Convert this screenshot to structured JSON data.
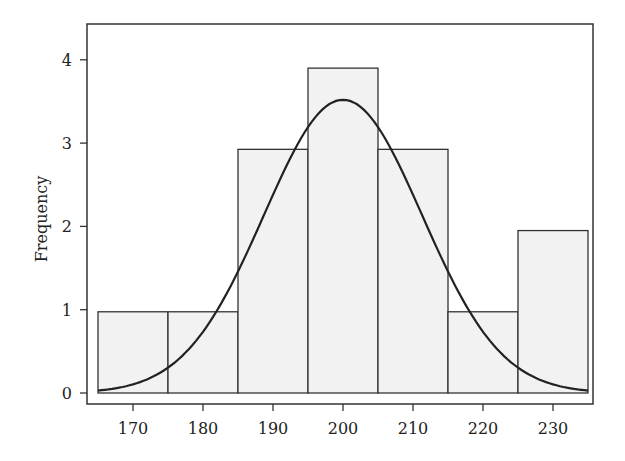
{
  "chart_data": {
    "type": "bar",
    "subtype": "histogram_with_normal_curve",
    "title": "",
    "xlabel": "",
    "ylabel": "Frequency",
    "bins": [
      {
        "start": 165,
        "end": 175,
        "count": 1
      },
      {
        "start": 175,
        "end": 185,
        "count": 1
      },
      {
        "start": 185,
        "end": 195,
        "count": 3
      },
      {
        "start": 195,
        "end": 205,
        "count": 4
      },
      {
        "start": 205,
        "end": 215,
        "count": 3
      },
      {
        "start": 215,
        "end": 225,
        "count": 1
      },
      {
        "start": 225,
        "end": 235,
        "count": 2
      }
    ],
    "categories": [
      "170",
      "180",
      "190",
      "200",
      "210",
      "220",
      "230"
    ],
    "values": [
      1,
      1,
      3,
      4,
      3,
      1,
      2
    ],
    "normal_curve": {
      "mean": 200,
      "sd": 11.3,
      "peak": 3.52,
      "points": [
        [
          165,
          0.27
        ],
        [
          175,
          0.9
        ],
        [
          185,
          1.93
        ],
        [
          195,
          3.2
        ],
        [
          200,
          3.52
        ],
        [
          205,
          3.2
        ],
        [
          215,
          1.93
        ],
        [
          225,
          0.9
        ],
        [
          235,
          0.32
        ]
      ]
    },
    "xticks": [
      170,
      180,
      190,
      200,
      210,
      220,
      230
    ],
    "yticks": [
      0,
      1,
      2,
      3,
      4
    ],
    "xlim": [
      163,
      236.5
    ],
    "ylim": [
      -0.15,
      4.4
    ],
    "grid": false,
    "legend": null,
    "colors": {
      "bar_fill": "#f2f2f2",
      "bar_edge": "#333333",
      "curve": "#222222",
      "frame": "#333333"
    }
  },
  "labels": {
    "ylabel": "Frequency",
    "yticks": [
      "0",
      "1",
      "2",
      "3",
      "4"
    ],
    "xticks": [
      "170",
      "180",
      "190",
      "200",
      "210",
      "220",
      "230"
    ]
  }
}
